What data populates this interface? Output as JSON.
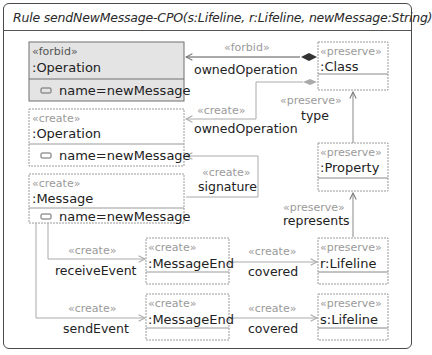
{
  "rule": {
    "title": "Rule sendNewMessage-CPO(s:Lifeline, r:Lifeline, newMessage:String)",
    "icon": "rule-arrow-icon"
  },
  "nodes": {
    "forbid_operation": {
      "stereotype": "«forbid»",
      "name": ":Operation",
      "attribute": "name=newMessage"
    },
    "create_operation": {
      "stereotype": "«create»",
      "name": ":Operation",
      "attribute": "name=newMessage"
    },
    "create_message": {
      "stereotype": "«create»",
      "name": ":Message",
      "attribute": "name=newMessage"
    },
    "preserve_class": {
      "stereotype": "«preserve»",
      "name": ":Class"
    },
    "preserve_property": {
      "stereotype": "«preserve»",
      "name": ":Property"
    },
    "receive_message_end": {
      "stereotype": "«create»",
      "name": ":MessageEnd"
    },
    "send_message_end": {
      "stereotype": "«create»",
      "name": ":MessageEnd"
    },
    "r_lifeline": {
      "stereotype": "«preserve»",
      "name": "r:Lifeline"
    },
    "s_lifeline": {
      "stereotype": "«preserve»",
      "name": "s:Lifeline"
    }
  },
  "edges": {
    "forbid_owned_operation": {
      "stereotype": "«forbid»",
      "label": "ownedOperation"
    },
    "create_owned_operation": {
      "stereotype": "«create»",
      "label": "ownedOperation"
    },
    "preserve_type": {
      "stereotype": "«preserve»",
      "label": "type"
    },
    "create_signature": {
      "stereotype": "«create»",
      "label": "signature"
    },
    "preserve_represents": {
      "stereotype": "«preserve»",
      "label": "represents"
    },
    "create_receive_event": {
      "stereotype": "«create»",
      "label": "receiveEvent"
    },
    "create_receive_covered": {
      "stereotype": "«create»",
      "label": "covered"
    },
    "create_send_event": {
      "stereotype": "«create»",
      "label": "sendEvent"
    },
    "create_send_covered": {
      "stereotype": "«create»",
      "label": "covered"
    }
  },
  "colors": {
    "forbid_fill": "#e4e4e4",
    "border": "#707070",
    "dashed": "#9a9a9a",
    "stereotype_text": "#9a9a9a",
    "text": "#222222"
  }
}
